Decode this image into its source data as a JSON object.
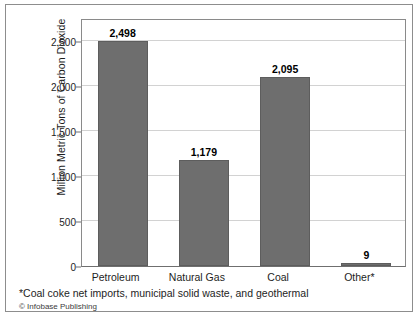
{
  "figure": {
    "footnote": "*Coal coke net imports, municipal solid waste, and geothermal",
    "credit": "© Infobase Publishing"
  },
  "chart_data": {
    "type": "bar",
    "title": "",
    "subtitle": "",
    "xlabel": "",
    "ylabel": "Million Metric Tons of Carbon Dioxide",
    "categories": [
      "Petroleum",
      "Natural Gas",
      "Coal",
      "Other*"
    ],
    "values": [
      2498,
      1179,
      2095,
      9
    ],
    "value_labels": [
      "2,498",
      "1,179",
      "2,095",
      "9"
    ],
    "ylim": [
      0,
      2750
    ],
    "yticks": [
      0,
      500,
      1000,
      1500,
      2000,
      2500
    ],
    "ytick_labels": [
      "0",
      "500",
      "1,000",
      "1,500",
      "2,000",
      "2,500"
    ],
    "grid": true,
    "grid_axis": "y",
    "legend": false,
    "legend_position": "none",
    "bar_color": "#6e6e6e",
    "bar_edge_color": "#5d5d5d",
    "grid_color": "#d2d2d2",
    "axis_color": "#8a8a8a",
    "text_color": "#1d1d1d",
    "background": "#ffffff"
  }
}
